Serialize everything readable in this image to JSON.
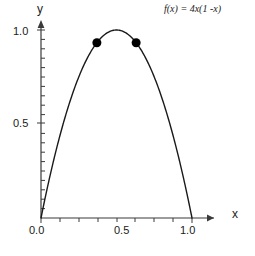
{
  "chart_data": {
    "type": "line",
    "title": "",
    "annotation_formula": "f(x) = 4x(1 -x)",
    "xlabel": "x",
    "ylabel": "y",
    "xlim": [
      0.0,
      1.0
    ],
    "ylim": [
      0.0,
      1.05
    ],
    "grid": false,
    "legend": null,
    "x_ticks_labeled": [
      {
        "value": 0.0,
        "label": "0.0"
      },
      {
        "value": 0.5,
        "label": "0.5"
      },
      {
        "value": 1.0,
        "label": "1.0"
      }
    ],
    "y_ticks_labeled": [
      {
        "value": 0.5,
        "label": "0.5"
      },
      {
        "value": 1.0,
        "label": "1.0"
      }
    ],
    "x_minor_tick_step": 0.125,
    "y_minor_tick_step": 0.05,
    "series": [
      {
        "name": "f(x) = 4x(1 -x)",
        "type": "line",
        "color": "#1a1a1a",
        "x": [
          0.0,
          0.05,
          0.1,
          0.15,
          0.2,
          0.25,
          0.3,
          0.35,
          0.4,
          0.45,
          0.5,
          0.55,
          0.6,
          0.65,
          0.7,
          0.75,
          0.8,
          0.85,
          0.9,
          0.95,
          1.0
        ],
        "y": [
          0.0,
          0.19,
          0.36,
          0.51,
          0.64,
          0.75,
          0.84,
          0.91,
          0.96,
          0.99,
          1.0,
          0.99,
          0.96,
          0.91,
          0.84,
          0.75,
          0.64,
          0.51,
          0.36,
          0.19,
          0.0
        ]
      }
    ],
    "markers": [
      {
        "name": "left-point",
        "x": 0.37,
        "y": 0.9324,
        "color": "#000000",
        "radius": 4.5
      },
      {
        "name": "right-point",
        "x": 0.63,
        "y": 0.9324,
        "color": "#000000",
        "radius": 4.5
      }
    ],
    "axes_style": {
      "color": "#3a3a3a",
      "arrowheads": true,
      "spine_left": true,
      "spine_bottom": true
    }
  }
}
